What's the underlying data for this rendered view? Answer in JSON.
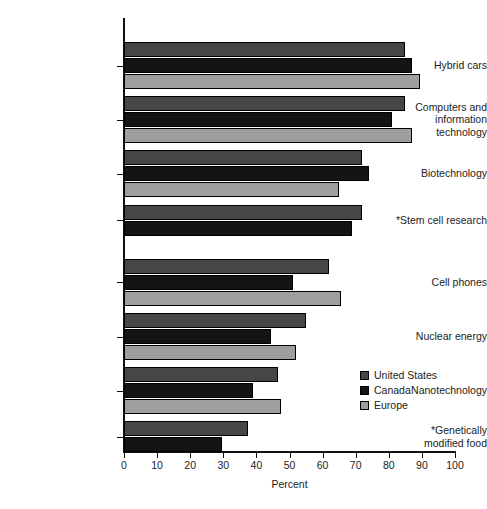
{
  "chart_data": {
    "type": "bar",
    "orientation": "horizontal",
    "title": "",
    "xlabel": "Percent",
    "ylabel": "",
    "xlim": [
      0,
      100
    ],
    "xticks": [
      0,
      10,
      20,
      30,
      40,
      50,
      60,
      70,
      80,
      90,
      100
    ],
    "xticklabels": [
      "0",
      "10",
      "20",
      "30",
      "40",
      "50",
      "60",
      "70",
      "80",
      "90",
      "100"
    ],
    "grid": false,
    "legend_position": "lower right",
    "categories": [
      "Hybrid cars",
      "Computers and\ninformation\ntechnology",
      "Biotechnology",
      "*Stem cell research",
      "Cell phones",
      "Nuclear energy",
      "Nanotechnology",
      "*Genetically\nmodified food"
    ],
    "series": [
      {
        "name": "United States",
        "color": "#464646",
        "values": [
          85,
          85,
          72,
          72,
          62,
          55,
          46.5,
          37.5
        ]
      },
      {
        "name": "Canada",
        "color": "#141414",
        "values": [
          87,
          81,
          74,
          69,
          51,
          44.5,
          39,
          29.5
        ]
      },
      {
        "name": "Europe",
        "color": "#9e9e9e",
        "values": [
          89.5,
          87,
          65,
          null,
          65.5,
          52,
          47.5,
          null
        ]
      }
    ]
  },
  "legend": {
    "items": [
      {
        "label": "United States",
        "swatch": "us"
      },
      {
        "label": "Canada",
        "swatch": "canada"
      },
      {
        "label": "Europe",
        "swatch": "europe"
      }
    ]
  }
}
